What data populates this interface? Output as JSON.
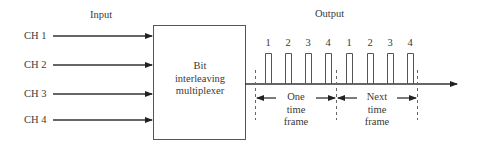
{
  "input_heading": "Input",
  "output_heading": "Output",
  "channels": [
    {
      "label": "CH 1"
    },
    {
      "label": "CH 2"
    },
    {
      "label": "CH 3"
    },
    {
      "label": "CH 4"
    }
  ],
  "multiplexer": {
    "line1": "Bit",
    "line2": "interleaving",
    "line3": "multiplexer"
  },
  "pulses": [
    {
      "label": "1"
    },
    {
      "label": "2"
    },
    {
      "label": "3"
    },
    {
      "label": "4"
    },
    {
      "label": "1"
    },
    {
      "label": "2"
    },
    {
      "label": "3"
    },
    {
      "label": "4"
    }
  ],
  "frames": [
    {
      "line1": "One",
      "line2": "time",
      "line3": "frame"
    },
    {
      "line1": "Next",
      "line2": "time",
      "line3": "frame"
    }
  ],
  "colors": {
    "stroke": "#333333",
    "text": "#3a3a3a"
  }
}
